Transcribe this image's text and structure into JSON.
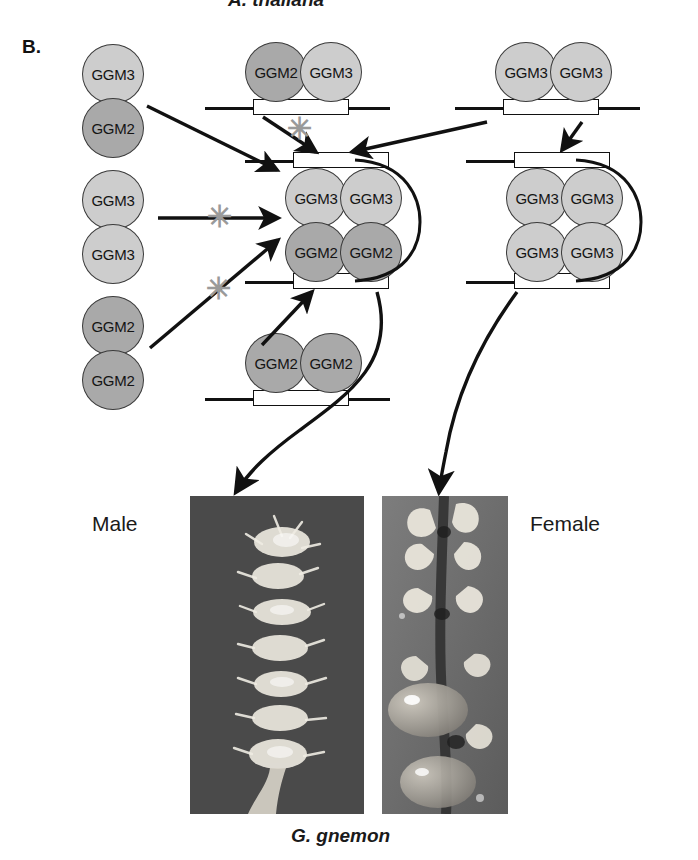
{
  "figure": {
    "panel_letter": "B.",
    "species_top": "A. thaliana",
    "species_bottom": "G. gnemon",
    "label_male": "Male",
    "label_female": "Female",
    "colors": {
      "ggm3_fill": "#cdcdcd",
      "ggm2_fill": "#a9a9a9",
      "outline": "#3a3a3a",
      "block_arrow": "#9a9a9a",
      "arrow": "#111111",
      "photo_male_bg": "#4a4a4a",
      "photo_female_bg": "#6f6f6f"
    },
    "block_symbol": "✳"
  },
  "proteins": {
    "ggm3": "GGM3",
    "ggm2": "GGM2"
  },
  "free_dimers": [
    {
      "id": "free-ggm3-ggm2",
      "top": "GGM3",
      "bottom": "GGM2",
      "top_type": "ggm3",
      "bottom_type": "ggm2"
    },
    {
      "id": "free-ggm3-ggm3",
      "top": "GGM3",
      "bottom": "GGM3",
      "top_type": "ggm3",
      "bottom_type": "ggm3"
    },
    {
      "id": "free-ggm2-ggm2",
      "top": "GGM2",
      "bottom": "GGM2",
      "top_type": "ggm2",
      "bottom_type": "ggm2"
    }
  ],
  "dna_bound_dimers": [
    {
      "id": "dna-dimer-ggm2-ggm3",
      "left": "GGM2",
      "right": "GGM3",
      "left_type": "ggm2",
      "right_type": "ggm3"
    },
    {
      "id": "dna-dimer-ggm3-ggm3",
      "left": "GGM3",
      "right": "GGM3",
      "left_type": "ggm3",
      "right_type": "ggm3"
    },
    {
      "id": "dna-dimer-ggm2-ggm2",
      "left": "GGM2",
      "right": "GGM2",
      "left_type": "ggm2",
      "right_type": "ggm2"
    }
  ],
  "tetramers": [
    {
      "id": "tetramer-male",
      "top_left": "GGM3",
      "top_right": "GGM3",
      "bottom_left": "GGM2",
      "bottom_right": "GGM2",
      "top_left_type": "ggm3",
      "top_right_type": "ggm3",
      "bottom_left_type": "ggm2",
      "bottom_right_type": "ggm2"
    },
    {
      "id": "tetramer-female",
      "top_left": "GGM3",
      "top_right": "GGM3",
      "bottom_left": "GGM3",
      "bottom_right": "GGM3",
      "top_left_type": "ggm3",
      "top_right_type": "ggm3",
      "bottom_left_type": "ggm3",
      "bottom_right_type": "ggm3"
    }
  ],
  "blocked_interactions": [
    {
      "id": "block-from-ggm2ggm3-dimer"
    },
    {
      "id": "block-from-free-ggm3-ggm3"
    },
    {
      "id": "block-from-free-ggm2-ggm2"
    }
  ]
}
